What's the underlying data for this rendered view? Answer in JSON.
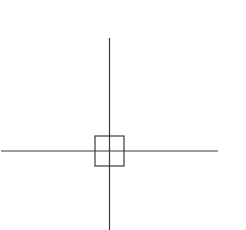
{
  "diagram": {
    "type": "crosshair",
    "background": "#ffffff",
    "stroke_color": "#3a3a3a",
    "stroke_width": 1.2,
    "vertical_line": {
      "x": 109.5,
      "y1": 38,
      "y2": 230
    },
    "horizontal_line": {
      "y": 151,
      "x1": 1,
      "x2": 218
    },
    "center_box": {
      "x": 95,
      "y": 136,
      "width": 29,
      "height": 30
    }
  }
}
